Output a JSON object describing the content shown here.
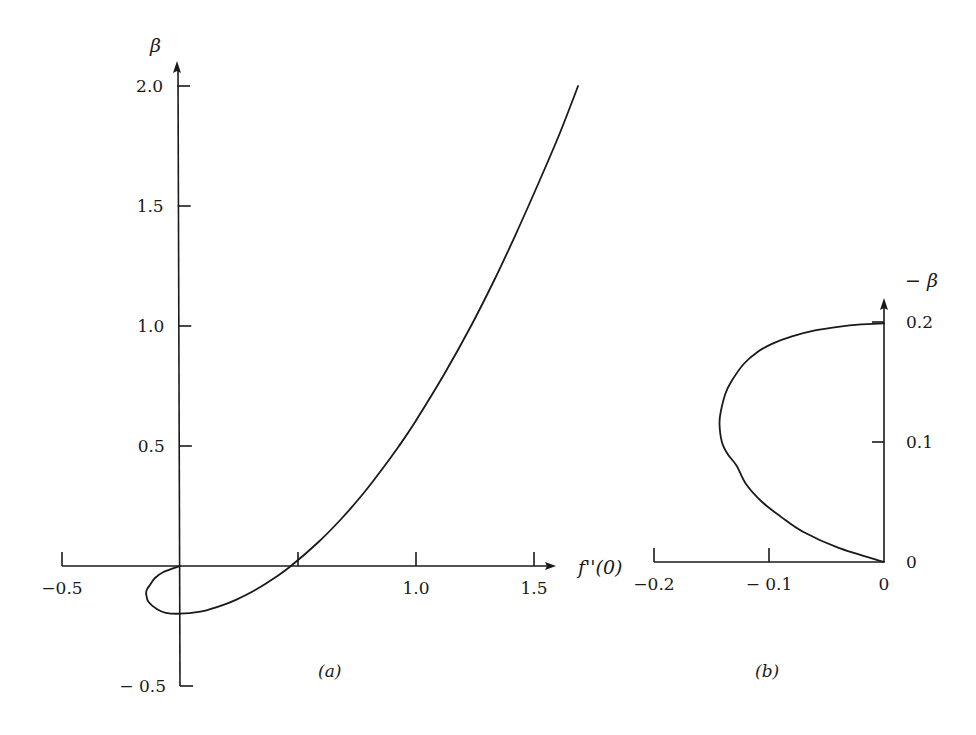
{
  "figure": {
    "background": "#ffffff",
    "ink": "#1a1a1a"
  },
  "chart_data": [
    {
      "panel": "a",
      "type": "line",
      "title": "",
      "panel_label": "(a)",
      "xlabel": "f''(0)",
      "ylabel": "β",
      "xlim": [
        -0.5,
        1.55
      ],
      "ylim": [
        -0.5,
        2.1
      ],
      "grid": false,
      "x_ticks": [
        -0.5,
        0.5,
        1.0,
        1.5
      ],
      "x_tick_labels": [
        "−0.5",
        "",
        "1.0",
        "1.5"
      ],
      "y_ticks": [
        -0.5,
        0.5,
        1.0,
        1.5,
        2.0
      ],
      "y_tick_labels": [
        "− 0.5",
        "0.5",
        "1.0",
        "1.5",
        "2.0"
      ],
      "series": [
        {
          "name": "β vs f''(0)",
          "points": [
            [
              1.687,
              2.0
            ],
            [
              1.608,
              1.8
            ],
            [
              1.521,
              1.6
            ],
            [
              1.431,
              1.4
            ],
            [
              1.336,
              1.2
            ],
            [
              1.233,
              1.0
            ],
            [
              1.12,
              0.8
            ],
            [
              0.996,
              0.6
            ],
            [
              0.928,
              0.5
            ],
            [
              0.854,
              0.4
            ],
            [
              0.775,
              0.3
            ],
            [
              0.687,
              0.2
            ],
            [
              0.587,
              0.1
            ],
            [
              0.47,
              0.0
            ],
            [
              0.4,
              -0.05
            ],
            [
              0.319,
              -0.1
            ],
            [
              0.239,
              -0.14
            ],
            [
              0.19,
              -0.16
            ],
            [
              0.128,
              -0.18
            ],
            [
              0.086,
              -0.19
            ],
            [
              0.0,
              -0.1988
            ],
            [
              -0.06,
              -0.195
            ],
            [
              -0.097,
              -0.18
            ],
            [
              -0.133,
              -0.15
            ],
            [
              -0.143,
              -0.12
            ],
            [
              -0.141,
              -0.1
            ],
            [
              -0.128,
              -0.08
            ],
            [
              -0.106,
              -0.05
            ],
            [
              -0.07,
              -0.025
            ],
            [
              0.0,
              0.0
            ]
          ]
        }
      ]
    },
    {
      "panel": "b",
      "type": "line",
      "title": "",
      "panel_label": "(b)",
      "xlabel": "",
      "ylabel": "− β",
      "xlim": [
        -0.2,
        0.0
      ],
      "ylim": [
        0.0,
        0.22
      ],
      "grid": false,
      "x_ticks": [
        -0.2,
        -0.1,
        0.0
      ],
      "x_tick_labels": [
        "−0.2",
        "− 0.1",
        "0"
      ],
      "y_ticks": [
        0.0,
        0.1,
        0.2
      ],
      "y_tick_labels": [
        "0",
        "0.1",
        "0.2"
      ],
      "series": [
        {
          "name": "−β vs f''(0) (lower branch)",
          "points": [
            [
              0.0,
              0.0
            ],
            [
              -0.04,
              0.012
            ],
            [
              -0.07,
              0.025
            ],
            [
              -0.09,
              0.038
            ],
            [
              -0.106,
              0.05
            ],
            [
              -0.12,
              0.065
            ],
            [
              -0.128,
              0.08
            ],
            [
              -0.136,
              0.09
            ],
            [
              -0.141,
              0.1
            ],
            [
              -0.143,
              0.115
            ],
            [
              -0.142,
              0.125
            ],
            [
              -0.138,
              0.14
            ],
            [
              -0.133,
              0.15
            ],
            [
              -0.122,
              0.165
            ],
            [
              -0.11,
              0.175
            ],
            [
              -0.097,
              0.182
            ],
            [
              -0.08,
              0.188
            ],
            [
              -0.06,
              0.193
            ],
            [
              -0.04,
              0.196
            ],
            [
              -0.02,
              0.198
            ],
            [
              0.0,
              0.1988
            ]
          ]
        }
      ]
    }
  ]
}
